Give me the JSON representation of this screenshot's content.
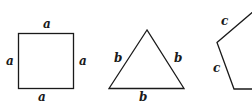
{
  "figure": {
    "shapes": [
      {
        "name": "square",
        "side_label": "a",
        "labels": {
          "top": "a",
          "left": "a",
          "right": "a",
          "bottom": "a"
        }
      },
      {
        "name": "equilateral-triangle",
        "side_label": "b",
        "labels": {
          "left": "b",
          "right": "b",
          "bottom": "b"
        }
      },
      {
        "name": "regular-pentagon-partial",
        "side_label": "c",
        "labels": {
          "upper_left": "c",
          "lower_left": "c"
        }
      }
    ],
    "colors": {
      "stroke": "#1a1a1a",
      "background": "#ffffff"
    }
  }
}
